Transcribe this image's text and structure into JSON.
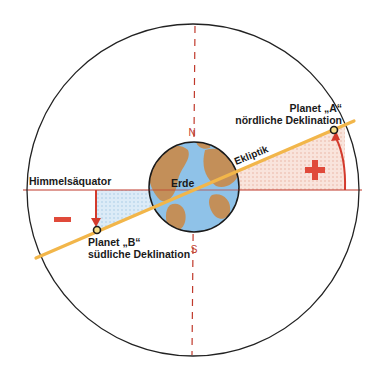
{
  "labels": {
    "equator": "Himmelsäquator",
    "ecliptic": "Ekliptik",
    "earth": "Erde",
    "north": "N",
    "south": "S",
    "planet_a_name": "Planet „A“",
    "planet_a_desc": "nördliche Deklination",
    "planet_b_name": "Planet „B“",
    "planet_b_desc": "südliche Deklination",
    "plus_sign": "+",
    "minus_sign": "−"
  },
  "colors": {
    "outer_circle": "#222222",
    "meridian": "#c0392b",
    "equator": "#c0392b",
    "ecliptic": "#f2b64a",
    "earth_ocean": "#8fc3e8",
    "earth_land": "#c98a4a",
    "north_region_fill": "#f6d9cf",
    "south_region_fill": "#cfe3f3",
    "arrow": "#d33a2c",
    "sign": "#e04a3a"
  }
}
